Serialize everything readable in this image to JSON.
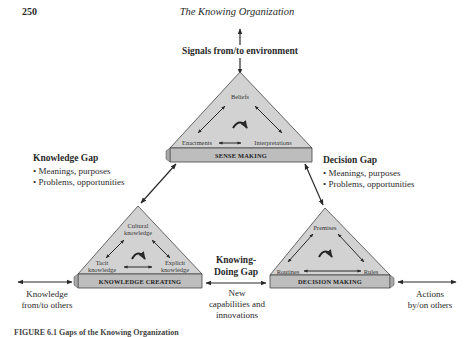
{
  "page": {
    "number": "250",
    "running_head": "The Knowing Organization",
    "caption": "FIGURE 6.1 Gaps of the Knowing Organization"
  },
  "environment": {
    "label": "Signals from/to environment"
  },
  "sense_making": {
    "bar_label": "SENSE MAKING",
    "nodes": [
      "Beliefs",
      "Enactments",
      "Interpretations"
    ]
  },
  "knowledge_creating": {
    "bar_label": "KNOWLEDGE CREATING",
    "nodes": [
      "Cultural knowledge",
      "Tacit knowledge",
      "Explicit knowledge"
    ],
    "node_lines": {
      "cultural": [
        "Cultural",
        "knowledge"
      ],
      "tacit": [
        "Tacit",
        "knowledge"
      ],
      "explicit": [
        "Explicit",
        "knowledge"
      ]
    }
  },
  "decision_making": {
    "bar_label": "DECISION MAKING",
    "nodes": [
      "Premises",
      "Routines",
      "Rules"
    ]
  },
  "gaps": {
    "knowledge_gap": {
      "title": "Knowledge Gap",
      "bullets": [
        "• Meanings, purposes",
        "• Problems, opportunities"
      ]
    },
    "decision_gap": {
      "title": "Decision Gap",
      "bullets": [
        "• Meanings, purposes",
        "• Problems, opportunities"
      ]
    },
    "knowing_doing_gap": {
      "title_lines": [
        "Knowing-",
        "Doing Gap"
      ]
    }
  },
  "flows": {
    "knowledge_others": [
      "Knowledge",
      "from/to others"
    ],
    "new_capabilities": [
      "New",
      "capabilities and",
      "innovations"
    ],
    "actions_others": [
      "Actions",
      "by/on others"
    ]
  },
  "colors": {
    "triangle_fill": "#cfcfcf",
    "bar_fill": "#bdbdbd",
    "stroke": "#333333",
    "text": "#2a2a2a"
  }
}
